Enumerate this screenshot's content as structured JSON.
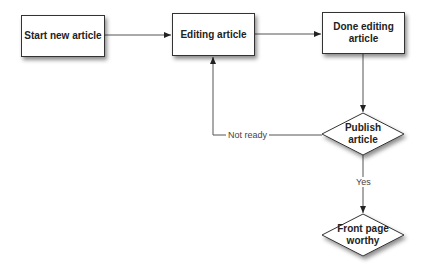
{
  "diagram": {
    "type": "flowchart",
    "nodes": [
      {
        "id": "start",
        "shape": "rectangle",
        "label": "Start new article"
      },
      {
        "id": "editing",
        "shape": "rectangle",
        "label": "Editing article"
      },
      {
        "id": "done",
        "shape": "rectangle",
        "label": "Done editing article"
      },
      {
        "id": "publish",
        "shape": "diamond",
        "label": "Publish article"
      },
      {
        "id": "frontpage",
        "shape": "diamond",
        "label": "Front page worthy"
      }
    ],
    "edges": [
      {
        "from": "start",
        "to": "editing",
        "label": ""
      },
      {
        "from": "editing",
        "to": "done",
        "label": ""
      },
      {
        "from": "done",
        "to": "publish",
        "label": ""
      },
      {
        "from": "publish",
        "to": "editing",
        "label": "Not ready"
      },
      {
        "from": "publish",
        "to": "frontpage",
        "label": "Yes"
      }
    ],
    "labels": {
      "start": "Start new article",
      "editing": "Editing article",
      "done_line1": "Done editing",
      "done_line2": "article",
      "publish_line1": "Publish",
      "publish_line2": "article",
      "frontpage_line1": "Front page",
      "frontpage_line2": "worthy",
      "not_ready": "Not ready",
      "yes": "Yes"
    },
    "colors": {
      "stroke": "#333333",
      "fill": "#ffffff",
      "text": "#222222"
    }
  }
}
